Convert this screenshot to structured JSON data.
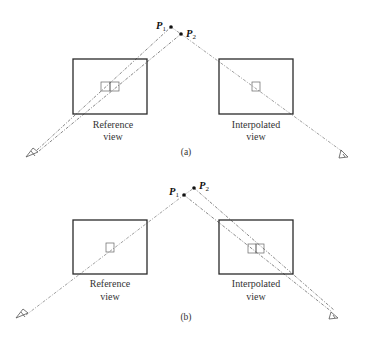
{
  "figure": {
    "panels": [
      {
        "id": "a",
        "caption": "(a)",
        "points": [
          {
            "name": "P",
            "sub": "1"
          },
          {
            "name": "P",
            "sub": "2"
          }
        ],
        "views": [
          {
            "label_line1": "Reference",
            "label_line2": "view",
            "pixel_count": 2
          },
          {
            "label_line1": "Interpolated",
            "label_line2": "view",
            "pixel_count": 1
          }
        ]
      },
      {
        "id": "b",
        "caption": "(b)",
        "points": [
          {
            "name": "P",
            "sub": "1"
          },
          {
            "name": "P",
            "sub": "2"
          }
        ],
        "views": [
          {
            "label_line1": "Reference",
            "label_line2": "view",
            "pixel_count": 1
          },
          {
            "label_line1": "Interpolated",
            "label_line2": "view",
            "pixel_count": 2
          }
        ]
      }
    ]
  }
}
